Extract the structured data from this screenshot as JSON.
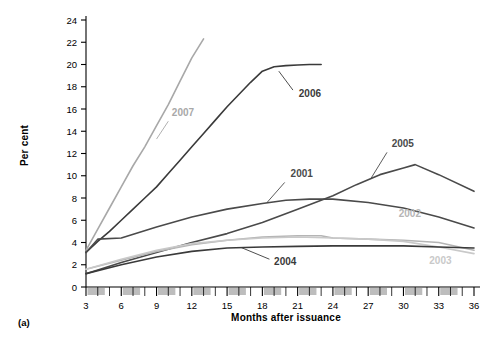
{
  "figure": {
    "panel_caption": "(a)",
    "ylabel": "Per cent",
    "xlabel": "Months after issuance"
  },
  "chart_data": {
    "type": "line",
    "title": "",
    "subtitle": "",
    "xlabel": "Months after issuance",
    "ylabel": "Per cent",
    "xlim": [
      3,
      36
    ],
    "ylim": [
      0,
      24
    ],
    "xticks": [
      3,
      6,
      9,
      12,
      15,
      18,
      21,
      24,
      27,
      30,
      33,
      36
    ],
    "xticklabels": [
      "3",
      "6",
      "9",
      "12",
      "15",
      "18",
      "21",
      "24",
      "27",
      "30",
      "33",
      "36"
    ],
    "yticks": [
      0,
      2,
      4,
      6,
      8,
      10,
      12,
      14,
      16,
      18,
      20,
      22,
      24
    ],
    "yticklabels": [
      "0",
      "2",
      "4",
      "6",
      "8",
      "10",
      "12",
      "14",
      "16",
      "18",
      "20",
      "22",
      "24"
    ],
    "grid": false,
    "legend": "inline-annotations",
    "annotations": [
      {
        "text": "2007",
        "x": 10.3,
        "y": 15.4
      },
      {
        "text": "2006",
        "x": 21.1,
        "y": 17.1
      },
      {
        "text": "2005",
        "x": 29.0,
        "y": 12.6
      },
      {
        "text": "2001",
        "x": 20.4,
        "y": 9.9
      },
      {
        "text": "2002",
        "x": 29.6,
        "y": 6.3
      },
      {
        "text": "2003",
        "x": 32.2,
        "y": 2.1
      },
      {
        "text": "2004",
        "x": 19.0,
        "y": 2.0
      }
    ],
    "series": [
      {
        "name": "2007",
        "color": "#a8a8a8",
        "x": [
          3,
          4,
          5,
          6,
          7,
          8,
          9,
          10,
          11,
          12,
          13
        ],
        "values": [
          3.3,
          5.2,
          7.1,
          9.0,
          10.9,
          12.6,
          14.5,
          16.4,
          18.5,
          20.6,
          22.3
        ]
      },
      {
        "name": "2006",
        "color": "#3a3a3a",
        "x": [
          3,
          4,
          5,
          6,
          7,
          8,
          9,
          10,
          11,
          12,
          13,
          14,
          15,
          16,
          17,
          18,
          19,
          20,
          21,
          22,
          23
        ],
        "values": [
          3.1,
          4.1,
          5.0,
          6.0,
          7.0,
          8.0,
          9.0,
          10.2,
          11.4,
          12.6,
          13.8,
          15.0,
          16.2,
          17.3,
          18.4,
          19.4,
          19.8,
          19.9,
          19.95,
          20.0,
          20.0
        ]
      },
      {
        "name": "2005",
        "color": "#4a4a4a",
        "x": [
          3,
          6,
          9,
          12,
          15,
          18,
          21,
          24,
          26,
          28,
          30,
          31,
          33,
          36
        ],
        "values": [
          1.2,
          2.2,
          3.1,
          4.0,
          4.8,
          5.8,
          7.0,
          8.2,
          9.2,
          10.1,
          10.7,
          11.0,
          10.1,
          8.6
        ]
      },
      {
        "name": "2001",
        "color": "#4a4a4a",
        "x": [
          3,
          4,
          6,
          9,
          12,
          15,
          18,
          20,
          22,
          24,
          27,
          30,
          33,
          36
        ],
        "values": [
          3.1,
          4.3,
          4.4,
          5.4,
          6.3,
          7.0,
          7.5,
          7.8,
          7.9,
          7.9,
          7.6,
          7.1,
          6.3,
          5.3
        ]
      },
      {
        "name": "2002",
        "color": "#b5b5b5",
        "x": [
          3,
          6,
          9,
          12,
          15,
          18,
          21,
          23,
          24,
          27,
          30,
          33,
          36
        ],
        "values": [
          1.6,
          2.4,
          3.2,
          3.8,
          4.2,
          4.5,
          4.6,
          4.6,
          4.4,
          4.3,
          4.2,
          4.0,
          3.3
        ]
      },
      {
        "name": "2003",
        "color": "#c9c9c9",
        "x": [
          3,
          6,
          9,
          12,
          15,
          18,
          21,
          24,
          27,
          30,
          33,
          36
        ],
        "values": [
          1.6,
          2.5,
          3.3,
          3.9,
          4.2,
          4.4,
          4.5,
          4.4,
          4.3,
          4.1,
          3.6,
          3.0
        ]
      },
      {
        "name": "2004",
        "color": "#3a3a3a",
        "x": [
          3,
          6,
          9,
          12,
          15,
          18,
          21,
          24,
          27,
          30,
          33,
          36
        ],
        "values": [
          1.2,
          2.0,
          2.7,
          3.2,
          3.5,
          3.6,
          3.65,
          3.7,
          3.7,
          3.7,
          3.6,
          3.5
        ]
      }
    ]
  }
}
